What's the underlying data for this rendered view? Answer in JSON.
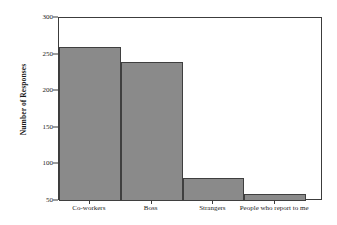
{
  "chart_data": {
    "type": "bar",
    "title": "",
    "xlabel": "",
    "ylabel": "Number of Responses",
    "categories": [
      "Co-workers",
      "Boss",
      "Strangers",
      "People who report to me"
    ],
    "values": [
      260,
      240,
      82,
      59
    ],
    "ylim": [
      50,
      300
    ],
    "yticks": [
      50,
      100,
      150,
      200,
      250,
      300
    ],
    "ytick_labels": [
      "50",
      "100",
      "150",
      "200",
      "250",
      "300"
    ],
    "grid": false,
    "legend": null,
    "bar_color": "#8a8a8a",
    "bar_edge_color": "#3f3f3f",
    "axis_color": "#3c3c3c",
    "background_color": "#ffffff",
    "bars_contiguous": true
  }
}
